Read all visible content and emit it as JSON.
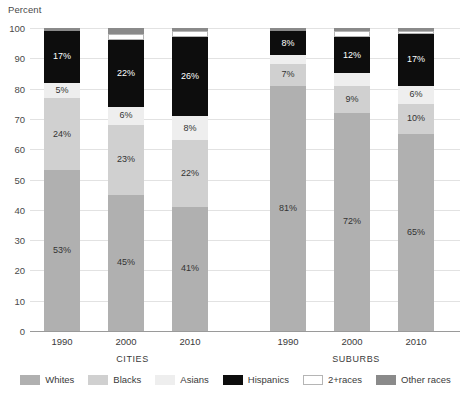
{
  "chart_data": {
    "type": "bar",
    "subtype": "stacked-100",
    "title": "",
    "ylabel": "Percent",
    "xlabel": "",
    "ylim": [
      0,
      100
    ],
    "yticks": [
      0,
      10,
      20,
      30,
      40,
      50,
      60,
      70,
      80,
      90,
      100
    ],
    "grid": true,
    "legend_position": "bottom",
    "categories": [
      "1990",
      "2000",
      "2010"
    ],
    "panels": [
      {
        "name": "CITIES",
        "bars": [
          {
            "category": "1990",
            "segments": [
              {
                "series": "Whites",
                "value": 53,
                "label": "53%",
                "show_label": true
              },
              {
                "series": "Blacks",
                "value": 24,
                "label": "24%",
                "show_label": true
              },
              {
                "series": "Asians",
                "value": 5,
                "label": "5%",
                "show_label": true
              },
              {
                "series": "Hispanics",
                "value": 17,
                "label": "17%",
                "show_label": true
              },
              {
                "series": "2+races",
                "value": 0,
                "label": "",
                "show_label": false
              },
              {
                "series": "Other races",
                "value": 1,
                "label": "",
                "show_label": false
              }
            ]
          },
          {
            "category": "2000",
            "segments": [
              {
                "series": "Whites",
                "value": 45,
                "label": "45%",
                "show_label": true
              },
              {
                "series": "Blacks",
                "value": 23,
                "label": "23%",
                "show_label": true
              },
              {
                "series": "Asians",
                "value": 6,
                "label": "6%",
                "show_label": true
              },
              {
                "series": "Hispanics",
                "value": 22,
                "label": "22%",
                "show_label": true
              },
              {
                "series": "2+races",
                "value": 2,
                "label": "",
                "show_label": false
              },
              {
                "series": "Other races",
                "value": 2,
                "label": "",
                "show_label": false
              }
            ]
          },
          {
            "category": "2010",
            "segments": [
              {
                "series": "Whites",
                "value": 41,
                "label": "41%",
                "show_label": true
              },
              {
                "series": "Blacks",
                "value": 22,
                "label": "22%",
                "show_label": true
              },
              {
                "series": "Asians",
                "value": 8,
                "label": "8%",
                "show_label": true
              },
              {
                "series": "Hispanics",
                "value": 26,
                "label": "26%",
                "show_label": true
              },
              {
                "series": "2+races",
                "value": 2,
                "label": "",
                "show_label": false
              },
              {
                "series": "Other races",
                "value": 1,
                "label": "",
                "show_label": false
              }
            ]
          }
        ]
      },
      {
        "name": "SUBURBS",
        "bars": [
          {
            "category": "1990",
            "segments": [
              {
                "series": "Whites",
                "value": 81,
                "label": "81%",
                "show_label": true
              },
              {
                "series": "Blacks",
                "value": 7,
                "label": "7%",
                "show_label": true
              },
              {
                "series": "Asians",
                "value": 3,
                "label": "",
                "show_label": false
              },
              {
                "series": "Hispanics",
                "value": 8,
                "label": "8%",
                "show_label": true
              },
              {
                "series": "2+races",
                "value": 0,
                "label": "",
                "show_label": false
              },
              {
                "series": "Other races",
                "value": 1,
                "label": "",
                "show_label": false
              }
            ]
          },
          {
            "category": "2000",
            "segments": [
              {
                "series": "Whites",
                "value": 72,
                "label": "72%",
                "show_label": true
              },
              {
                "series": "Blacks",
                "value": 9,
                "label": "9%",
                "show_label": true
              },
              {
                "series": "Asians",
                "value": 4,
                "label": "",
                "show_label": false
              },
              {
                "series": "Hispanics",
                "value": 12,
                "label": "12%",
                "show_label": true
              },
              {
                "series": "2+races",
                "value": 2,
                "label": "",
                "show_label": false
              },
              {
                "series": "Other races",
                "value": 1,
                "label": "",
                "show_label": false
              }
            ]
          },
          {
            "category": "2010",
            "segments": [
              {
                "series": "Whites",
                "value": 65,
                "label": "65%",
                "show_label": true
              },
              {
                "series": "Blacks",
                "value": 10,
                "label": "10%",
                "show_label": true
              },
              {
                "series": "Asians",
                "value": 6,
                "label": "6%",
                "show_label": true
              },
              {
                "series": "Hispanics",
                "value": 17,
                "label": "17%",
                "show_label": true
              },
              {
                "series": "2+races",
                "value": 1,
                "label": "",
                "show_label": false
              },
              {
                "series": "Other races",
                "value": 1,
                "label": "",
                "show_label": false
              }
            ]
          }
        ]
      }
    ],
    "series_styles": {
      "Whites": {
        "color": "#b0b0b0",
        "label_color": "dark"
      },
      "Blacks": {
        "color": "#d0d0d0",
        "label_color": "dark"
      },
      "Asians": {
        "color": "#eeeeee",
        "label_color": "dark"
      },
      "Hispanics": {
        "color": "#0d0d0d",
        "label_color": "light"
      },
      "2+races": {
        "color": "#ffffff",
        "label_color": "dark"
      },
      "Other races": {
        "color": "#8a8a8a",
        "label_color": "dark"
      }
    },
    "legend": [
      {
        "label": "Whites",
        "color": "#b0b0b0"
      },
      {
        "label": "Blacks",
        "color": "#d0d0d0"
      },
      {
        "label": "Asians",
        "color": "#eeeeee"
      },
      {
        "label": "Hispanics",
        "color": "#0d0d0d"
      },
      {
        "label": "2+races",
        "color": "#ffffff"
      },
      {
        "label": "Other races",
        "color": "#8a8a8a"
      }
    ]
  }
}
